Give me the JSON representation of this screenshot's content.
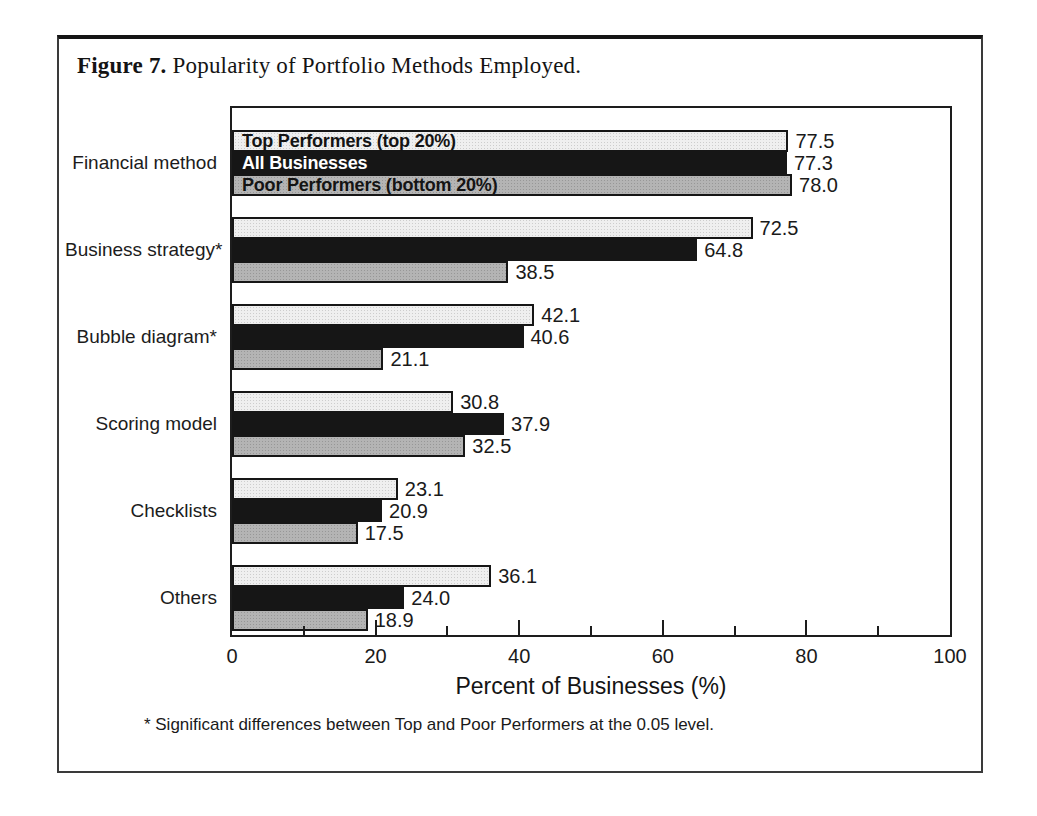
{
  "figure": {
    "title_label": "Figure 7.",
    "title_text": " Popularity of Portfolio Methods Employed."
  },
  "chart_data": {
    "type": "bar",
    "orientation": "horizontal",
    "title": "Figure 7. Popularity of Portfolio Methods Employed.",
    "categories": [
      "Financial method",
      "Business strategy*",
      "Bubble diagram*",
      "Scoring model",
      "Checklists",
      "Others"
    ],
    "series": [
      {
        "name": "Top Performers (top 20%)",
        "fill": "#efefef",
        "label_color": "#141414",
        "values": [
          77.5,
          72.5,
          42.1,
          30.8,
          23.1,
          36.1
        ]
      },
      {
        "name": "All Businesses",
        "fill": "#161616",
        "label_color": "#ffffff",
        "values": [
          77.3,
          64.8,
          40.6,
          37.9,
          20.9,
          24.0
        ]
      },
      {
        "name": "Poor Performers (bottom 20%)",
        "fill": "#b4b4b4",
        "label_color": "#141414",
        "values": [
          78.0,
          38.5,
          21.1,
          32.5,
          17.5,
          18.9
        ]
      }
    ],
    "xlabel": "Percent of Businesses (%)",
    "xlim": [
      0,
      100
    ],
    "x_major_ticks": [
      0,
      20,
      40,
      60,
      80,
      100
    ],
    "x_minor_ticks": [
      10,
      30,
      50,
      70,
      90
    ],
    "value_decimals": 1,
    "legend_position": "inside-first-group-bars",
    "grid": false
  },
  "footnote": "* Significant differences between Top and Poor Performers at the 0.05 level."
}
